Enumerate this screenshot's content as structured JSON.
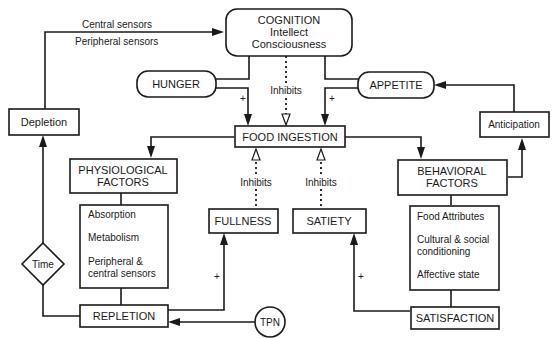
{
  "diagram": {
    "nodes": {
      "cognition": {
        "title": "COGNITION",
        "line2": "Intellect",
        "line3": "Consciousness"
      },
      "hunger": {
        "label": "HUNGER"
      },
      "appetite": {
        "label": "APPETITE"
      },
      "food_ingestion": {
        "label": "FOOD INGESTION"
      },
      "depletion": {
        "label": "Depletion"
      },
      "anticipation": {
        "label": "Anticipation"
      },
      "physiological": {
        "line1": "PHYSIOLOGICAL",
        "line2": "FACTORS"
      },
      "behavioral": {
        "line1": "BEHAVIORAL",
        "line2": "FACTORS"
      },
      "physiological_details": {
        "item1": "Absorption",
        "item2": "Metabolism",
        "item3a": "Peripheral &",
        "item3b": "central sensors"
      },
      "behavioral_details": {
        "item1": "Food Attributes",
        "item2a": "Cultural & social",
        "item2b": "conditioning",
        "item3": "Affective state"
      },
      "fullness": {
        "label": "FULLNESS"
      },
      "satiety": {
        "label": "SATIETY"
      },
      "time": {
        "label": "Time"
      },
      "repletion": {
        "label": "REPLETION"
      },
      "satisfaction": {
        "label": "SATISFACTION"
      },
      "tpn": {
        "label": "TPN"
      }
    },
    "edge_labels": {
      "central_sensors": "Central sensors",
      "peripheral_sensors": "Peripheral sensors",
      "inhibits": "Inhibits",
      "plus": "+"
    }
  }
}
